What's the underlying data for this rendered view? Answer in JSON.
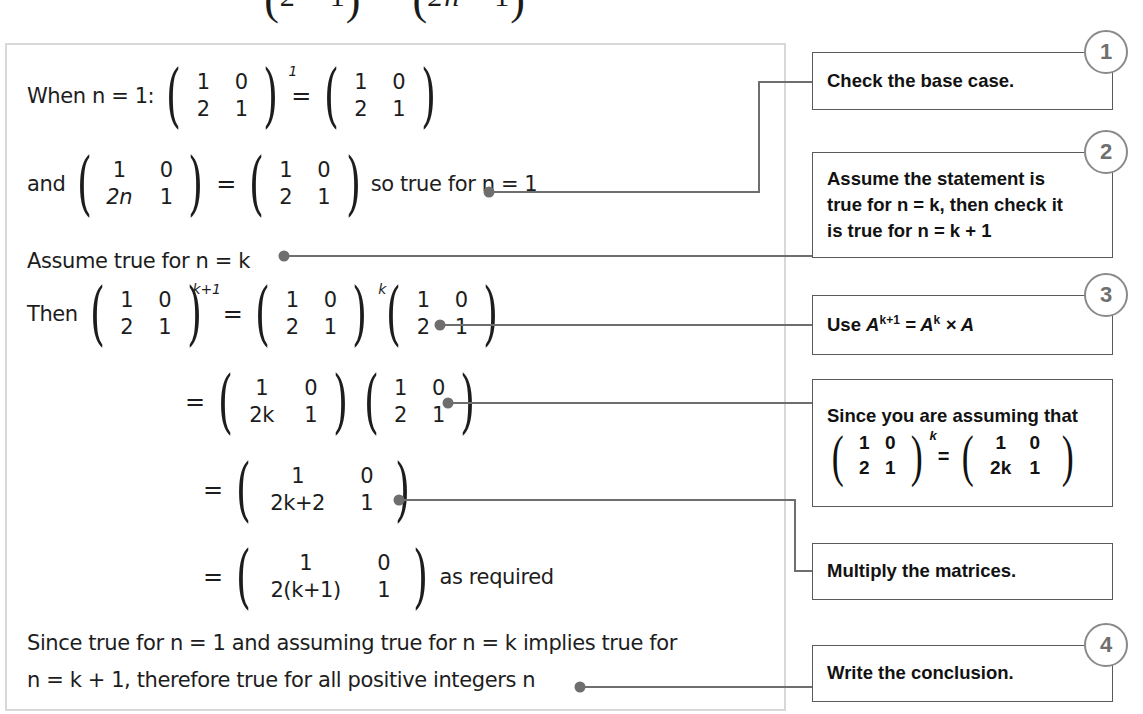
{
  "top_fragment": {
    "left_matrix": {
      "row1": [
        "2",
        "1"
      ]
    },
    "right_matrix": {
      "row1": [
        "2n",
        "1"
      ]
    }
  },
  "proof": {
    "line1": {
      "lead": "When n = 1:",
      "matrix_a": {
        "rows": [
          [
            "1",
            "0"
          ],
          [
            "2",
            "1"
          ]
        ],
        "power": "1"
      },
      "equals": "=",
      "matrix_b": {
        "rows": [
          [
            "1",
            "0"
          ],
          [
            "2",
            "1"
          ]
        ]
      }
    },
    "line2": {
      "lead": "and",
      "matrix_a": {
        "rows": [
          [
            "1",
            "0"
          ],
          [
            "2n",
            "1"
          ]
        ]
      },
      "equals": "=",
      "matrix_b": {
        "rows": [
          [
            "1",
            "0"
          ],
          [
            "2",
            "1"
          ]
        ]
      },
      "tail": "so true for n = 1"
    },
    "line3": {
      "text": "Assume true for n = k"
    },
    "line4": {
      "lead": "Then",
      "matrix_a": {
        "rows": [
          [
            "1",
            "0"
          ],
          [
            "2",
            "1"
          ]
        ],
        "power": "k+1"
      },
      "equals": "=",
      "matrix_b": {
        "rows": [
          [
            "1",
            "0"
          ],
          [
            "2",
            "1"
          ]
        ],
        "power": "k"
      },
      "matrix_c": {
        "rows": [
          [
            "1",
            "0"
          ],
          [
            "2",
            "1"
          ]
        ]
      }
    },
    "line5": {
      "equals": "=",
      "matrix_a": {
        "rows": [
          [
            "1",
            "0"
          ],
          [
            "2k",
            "1"
          ]
        ]
      },
      "matrix_b": {
        "rows": [
          [
            "1",
            "0"
          ],
          [
            "2",
            "1"
          ]
        ]
      }
    },
    "line6": {
      "equals": "=",
      "matrix_a": {
        "rows": [
          [
            "1",
            "0"
          ],
          [
            "2k+2",
            "1"
          ]
        ]
      }
    },
    "line7": {
      "equals": "=",
      "matrix_a": {
        "rows": [
          [
            "1",
            "0"
          ],
          [
            "2(k+1)",
            "1"
          ]
        ]
      },
      "tail": "as required"
    },
    "line8": {
      "text_line1": "Since true for n = 1 and assuming true for n = k implies true for",
      "text_line2": "n = k + 1, therefore true for all positive integers n"
    }
  },
  "notes": [
    {
      "id": "note-base-case",
      "badge": "1",
      "text": "Check the base case."
    },
    {
      "id": "note-assume",
      "badge": "2",
      "lines": [
        "Assume the statement is",
        "true for n = k, then check it",
        "is true for n = k + 1"
      ]
    },
    {
      "id": "note-power-rule",
      "badge": "3",
      "prefix": "Use ",
      "formula": "A^{k+1} = A^k × A"
    },
    {
      "id": "note-since-assume",
      "badge": "",
      "heading": "Since you are assuming that",
      "matrix_a": {
        "rows": [
          [
            "1",
            "0"
          ],
          [
            "2",
            "1"
          ]
        ],
        "power": "k"
      },
      "equals": "=",
      "matrix_b": {
        "rows": [
          [
            "1",
            "0"
          ],
          [
            "2k",
            "1"
          ]
        ]
      }
    },
    {
      "id": "note-multiply",
      "badge": "",
      "text": "Multiply the matrices."
    },
    {
      "id": "note-conclusion",
      "badge": "4",
      "text": "Write the conclusion."
    }
  ],
  "colors": {
    "panel_border": "#d8d8d8",
    "note_border": "#5a5a5a",
    "badge_border": "#8a8a8a",
    "badge_text": "#6f6f6f",
    "connector": "#6e6e6e",
    "ink": "#1d1d1d"
  }
}
